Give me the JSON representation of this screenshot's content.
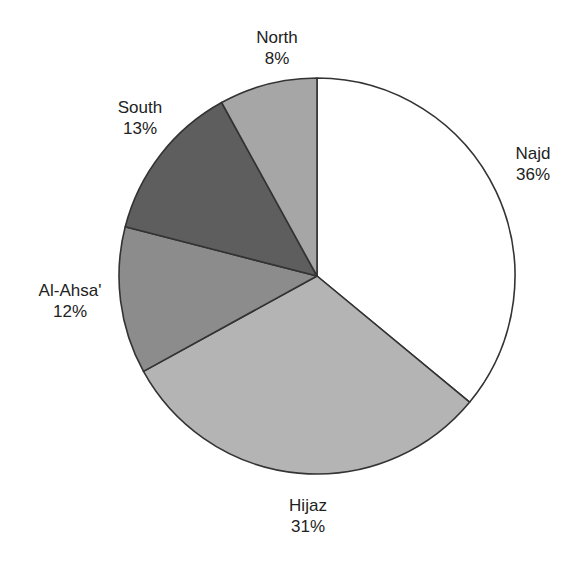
{
  "chart_data": {
    "type": "pie",
    "title": "",
    "categories": [
      "Najd",
      "Hijaz",
      "Al-Ahsa'",
      "South",
      "North"
    ],
    "values": [
      36,
      31,
      12,
      13,
      8
    ],
    "unit": "%",
    "start_angle": "12 o'clock",
    "direction": "clockwise",
    "legend": "none (direct labels)",
    "colors": [
      "#ffffff",
      "#b4b4b4",
      "#8c8c8c",
      "#5e5e5e",
      "#a6a6a6"
    ]
  },
  "labels": {
    "najd": {
      "name": "Najd",
      "pct": "36%"
    },
    "hijaz": {
      "name": "Hijaz",
      "pct": "31%"
    },
    "alahsa": {
      "name": "Al-Ahsa'",
      "pct": "12%"
    },
    "south": {
      "name": "South",
      "pct": "13%"
    },
    "north": {
      "name": "North",
      "pct": "8%"
    }
  }
}
